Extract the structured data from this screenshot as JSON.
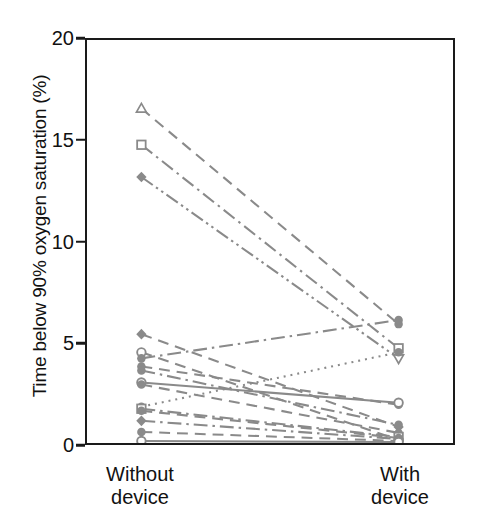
{
  "chart_data": {
    "type": "line",
    "title": "",
    "subtitle": "",
    "xlabel": "",
    "ylabel": "Time below 90% oxygen saturation (%)",
    "categories": [
      "Without\ndevice",
      "With\ndevice"
    ],
    "category_labels_flat": [
      "Without device",
      "With device"
    ],
    "x": [
      0,
      1
    ],
    "ylim": [
      0,
      20
    ],
    "yticks": [
      0,
      5,
      10,
      15,
      20
    ],
    "ytick_labels": [
      "0",
      "5",
      "10",
      "15",
      "20"
    ],
    "grid": false,
    "legend": "none",
    "legend_position": "none",
    "annotations": [],
    "line_color": "#8a8a8a",
    "axis_color": "#1a1a1a",
    "n_subjects": 16,
    "series": [
      {
        "name": "Subject 1",
        "values": [
          16.6,
          5.9
        ],
        "marker": "triangle-up-open",
        "dash": "dashed"
      },
      {
        "name": "Subject 2",
        "values": [
          14.8,
          4.7
        ],
        "marker": "square-open",
        "dash": "dash-dot"
      },
      {
        "name": "Subject 3",
        "values": [
          13.2,
          4.2
        ],
        "marker": "diamond-filled",
        "dash": "dash-dot-dot"
      },
      {
        "name": "Subject 4",
        "values": [
          5.4,
          0.8
        ],
        "marker": "diamond-filled",
        "dash": "dashed"
      },
      {
        "name": "Subject 5",
        "values": [
          4.5,
          0.15
        ],
        "marker": "circle-open",
        "dash": "dashed"
      },
      {
        "name": "Subject 6",
        "values": [
          4.2,
          6.1
        ],
        "marker": "circle-filled",
        "dash": "dash-dot"
      },
      {
        "name": "Subject 7",
        "values": [
          3.8,
          1.9
        ],
        "marker": "circle-filled",
        "dash": "dashed"
      },
      {
        "name": "Subject 8",
        "values": [
          3.6,
          0.9
        ],
        "marker": "circle-filled",
        "dash": "dash-dot"
      },
      {
        "name": "Subject 9",
        "values": [
          3.0,
          2.0
        ],
        "marker": "circle-open",
        "dash": "solid"
      },
      {
        "name": "Subject 10",
        "values": [
          2.9,
          0.5
        ],
        "marker": "circle-filled",
        "dash": "dashed"
      },
      {
        "name": "Subject 11",
        "values": [
          1.8,
          4.5
        ],
        "marker": "circle-filled",
        "dash": "dotted"
      },
      {
        "name": "Subject 12",
        "values": [
          1.7,
          0.3
        ],
        "marker": "square-open",
        "dash": "dash-dot"
      },
      {
        "name": "Subject 13",
        "values": [
          1.6,
          0.25
        ],
        "marker": "circle-filled",
        "dash": "dashed"
      },
      {
        "name": "Subject 14",
        "values": [
          1.1,
          0.2
        ],
        "marker": "diamond-filled",
        "dash": "dash-dot"
      },
      {
        "name": "Subject 15",
        "values": [
          0.55,
          0.1
        ],
        "marker": "circle-filled",
        "dash": "dashed"
      },
      {
        "name": "Subject 16",
        "values": [
          0.1,
          0.05
        ],
        "marker": "circle-open",
        "dash": "solid"
      }
    ]
  }
}
